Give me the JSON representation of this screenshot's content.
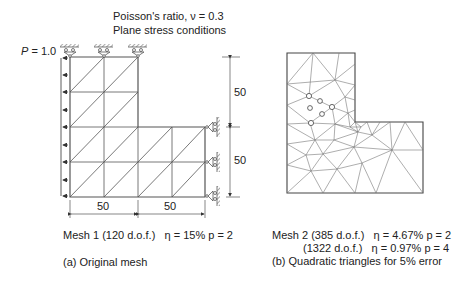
{
  "header": {
    "poisson": "Poisson's ratio, ν = 0.3",
    "plane_stress": "Plane stress conditions"
  },
  "left_panel": {
    "load_label_var": "P",
    "load_label_val": " = 1.0",
    "dim_height_top": "50",
    "dim_height_bottom": "50",
    "dim_width_left": "50",
    "dim_width_right": "50",
    "mesh_caption": "Mesh 1 (120 d.o.f.)   η = 15% p = 2",
    "subcaption": "(a) Original mesh"
  },
  "right_panel": {
    "mesh_caption_1": "Mesh 2 (385 d.o.f.)   η = 4.67% p = 2",
    "mesh_caption_2": "(1322 d.o.f.)   η = 0.97% p = 4",
    "subcaption": "(b) Quadratic triangles for 5% error"
  },
  "colors": {
    "line": "#555555",
    "text": "#222222"
  }
}
